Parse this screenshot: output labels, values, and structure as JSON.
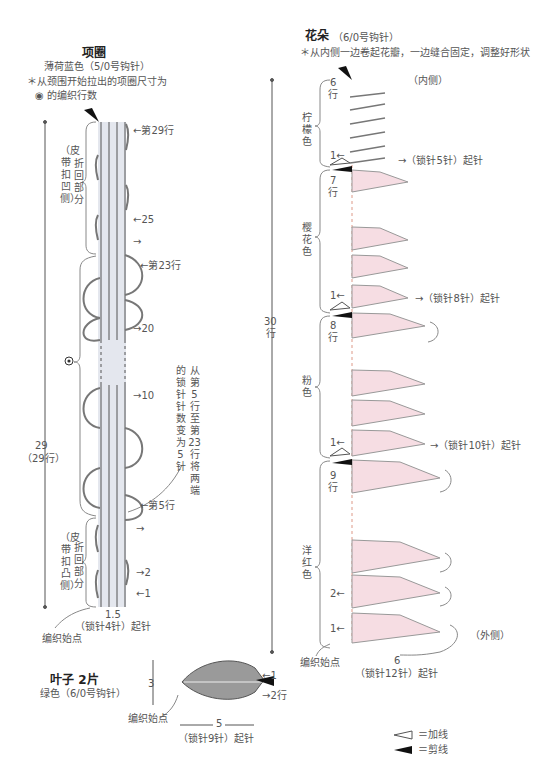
{
  "collar": {
    "title": "项圈",
    "color_hook": "薄荷蓝色（5/0号钩针）",
    "note_line1": "＊从颈围开始拉出的项圈尺寸为",
    "note_line2": "◉ 的编织行数",
    "row29": "←第29行",
    "row25": "←25",
    "row24": "→",
    "row23": "←第23行",
    "row20": "→20",
    "row10": "→10",
    "row5": "←第5行",
    "row4": "→",
    "row2": "→2",
    "row1": "←1",
    "fold_top_paren": "（皮带扣凹侧）",
    "fold_top_label": "折回部分",
    "fold_bottom_paren": "（皮带扣凸侧）",
    "fold_bottom_label": "折回部分",
    "height_value": "29",
    "height_rows": "（29行）",
    "width_value": "1.5",
    "foundation": "（锁针4针）起针",
    "start_point": "编织始点",
    "side_note_col1": "的锁针针数变为5针",
    "side_note_col2": "从第5行至第23行将两端",
    "target_mark": "◉"
  },
  "flower": {
    "title": "花朵",
    "hook": "（6/0号钩针）",
    "note": "＊从内侧一边卷起花瓣，一边缝合固定，调整好形状",
    "inner_label": "（内侧）",
    "outer_label": "（外侧）",
    "total_rows_value": "30",
    "total_rows_unit": "行",
    "sections": [
      {
        "color": "柠檬色",
        "rows": "6",
        "rows_unit": "行",
        "first_row": "1←",
        "foundation": "→（锁针5针）起针"
      },
      {
        "color": "樱花色",
        "rows": "7",
        "rows_unit": "行",
        "first_row": "1←",
        "foundation": "→（锁针8针）起针"
      },
      {
        "color": "粉色",
        "rows": "8",
        "rows_unit": "行",
        "first_row": "1←",
        "foundation": "→（锁针10针）起针"
      },
      {
        "color": "洋红色",
        "rows": "9",
        "rows_unit": "行",
        "first_row": "1←",
        "row2": "2←",
        "foundation": "（锁针12针）起针",
        "width_value": "6"
      }
    ],
    "start_point": "编织始点"
  },
  "leaf": {
    "title": "叶子 2片",
    "color_hook": "绿色（6/0号钩针）",
    "height_value": "3",
    "width_value": "5",
    "foundation": "（锁针9针）起针",
    "start_point": "编织始点",
    "row1": "←1",
    "row2": "→2行"
  },
  "legend": {
    "add_yarn": "＝加线",
    "cut_yarn": "＝剪线"
  },
  "colors": {
    "collar_fill": "#e4e7ee",
    "flower_fill": "#f6dde3",
    "leaf_fill": "#9a9a9a",
    "line": "#555555"
  }
}
